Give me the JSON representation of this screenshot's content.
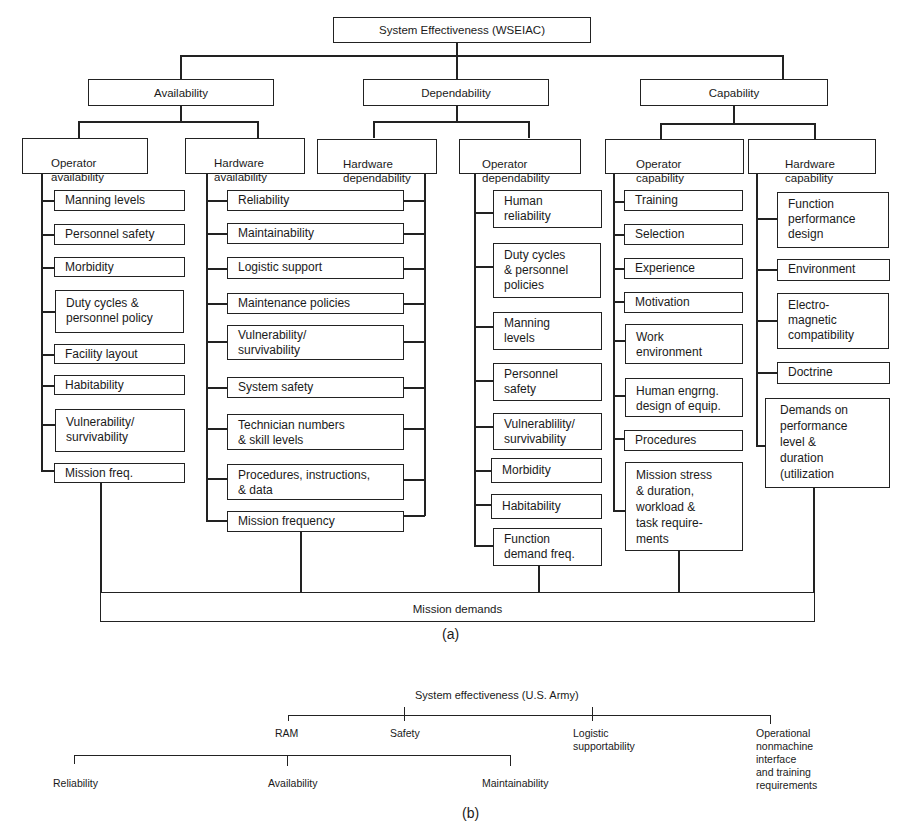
{
  "diagram_a": {
    "root": "System Effectiveness (WSEIAC)",
    "level1": [
      {
        "label": "Availability"
      },
      {
        "label": "Dependability"
      },
      {
        "label": "Capability"
      }
    ],
    "groups": [
      {
        "label": "Operator\navailability",
        "items": [
          "Manning levels",
          "Personnel safety",
          "Morbidity",
          "Duty cycles &\npersonnel policy",
          "Facility layout",
          "Habitability",
          "Vulnerability/\nsurvivability",
          "Mission freq."
        ]
      },
      {
        "label": "Hardware\navailability",
        "items": [
          "Reliability",
          "Maintainability",
          "Logistic support",
          "Maintenance policies",
          "Vulnerability/\nsurvivability",
          "System safety",
          "Technician numbers\n& skill levels",
          "Procedures, instructions,\n& data",
          "Mission frequency"
        ]
      },
      {
        "label": "Hardware\ndependability",
        "items": []
      },
      {
        "label": "Operator\ndependability",
        "items": [
          "Human\nreliability",
          "Duty cycles\n& personnel\npolicies",
          "Manning\nlevels",
          "Personnel\nsafety",
          "Vulnerablility/\nsurvivability",
          "Morbidity",
          "Habitability",
          "Function\ndemand freq."
        ]
      },
      {
        "label": "Operator\ncapability",
        "items": [
          "Training",
          "Selection",
          "Experience",
          "Motivation",
          "Work\nenvironment",
          "Human engrng.\ndesign of equip.",
          "Procedures",
          "Mission stress\n& duration,\nworkload &\ntask require-\nments"
        ]
      },
      {
        "label": "Hardware\ncapability",
        "items": [
          "Function\nperformance\ndesign",
          "Environment",
          "Electro-\nmagnetic\ncompatibility",
          "Doctrine",
          "Demands on\nperformance\nlevel &\nduration\n(utilization"
        ]
      }
    ],
    "bottom": "Mission demands",
    "caption": "(a)"
  },
  "diagram_b": {
    "root": "System effectiveness (U.S. Army)",
    "level1": [
      "RAM",
      "Safety",
      "Logistic\nsupportability",
      "Operational\nnonmachine\ninterface\nand training\nrequirements"
    ],
    "ram_children": [
      "Reliability",
      "Availability",
      "Maintainability"
    ],
    "caption": "(b)"
  }
}
